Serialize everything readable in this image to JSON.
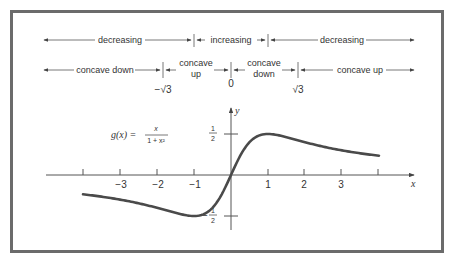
{
  "diagram": {
    "function_label": {
      "lhs": "g(x) =",
      "numerator": "x",
      "denominator": "1 + x²"
    },
    "monotonicity_row": [
      {
        "label": "decreasing",
        "from": "-∞",
        "to": "-1"
      },
      {
        "label": "increasing",
        "from": "-1",
        "to": "1"
      },
      {
        "label": "decreasing",
        "from": "1",
        "to": "∞"
      }
    ],
    "concavity_row": [
      {
        "label": "concave down",
        "from": "-∞",
        "to": "-√3"
      },
      {
        "label_line1": "concave",
        "label_line2": "up",
        "from": "-√3",
        "to": "0"
      },
      {
        "label_line1": "concave",
        "label_line2": "down",
        "from": "0",
        "to": "√3"
      },
      {
        "label": "concave up",
        "from": "√3",
        "to": "∞"
      }
    ],
    "concavity_markers": [
      "−√3",
      "0",
      "√3"
    ],
    "x_axis": {
      "label": "x",
      "ticks": [
        "−3",
        "−2",
        "−1",
        "1",
        "2",
        "3"
      ]
    },
    "y_axis": {
      "label": "y",
      "ticks": [
        {
          "num": "1",
          "den": "2",
          "sign": ""
        },
        {
          "num": "1",
          "den": "2",
          "sign": "−"
        }
      ]
    }
  },
  "chart_data": {
    "type": "line",
    "xlabel": "x",
    "ylabel": "y",
    "xlim": [
      -4,
      4
    ],
    "ylim": [
      -0.5,
      0.5
    ],
    "x": [
      -4,
      -3,
      -2,
      -1,
      0,
      1,
      2,
      3,
      4
    ],
    "series": [
      {
        "name": "g(x)",
        "values": [
          -0.235,
          -0.3,
          -0.4,
          -0.5,
          0,
          0.5,
          0.4,
          0.3,
          0.235
        ]
      }
    ],
    "annotations": [
      "max at (1, 1/2)",
      "min at (-1, -1/2)",
      "inflection points at x = -√3, 0, √3"
    ],
    "grid": false
  }
}
